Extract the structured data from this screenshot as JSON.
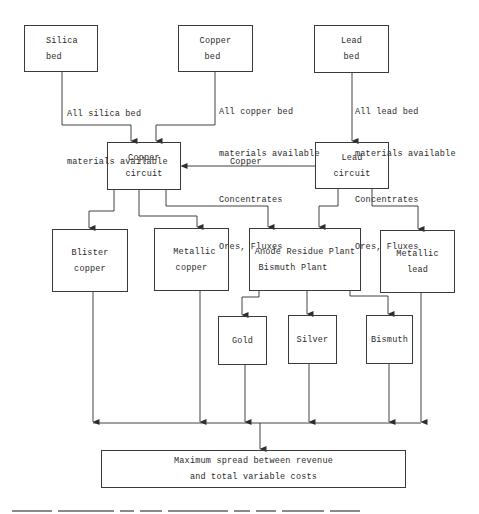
{
  "diagram": {
    "type": "flowchart",
    "nodes": {
      "silica_bed": {
        "line1": "Silica",
        "line2": "bed"
      },
      "copper_bed": {
        "line1": "Copper",
        "line2": "bed"
      },
      "lead_bed": {
        "line1": "Lead",
        "line2": "bed"
      },
      "copper_circuit": {
        "line1": "Copper",
        "line2": "circuit"
      },
      "lead_circuit": {
        "line1": "Lead",
        "line2": "circuit"
      },
      "blister_copper": {
        "line1": "Blister",
        "line2": "copper"
      },
      "metallic_copper": {
        "line1": "Metallic",
        "line2": "copper"
      },
      "anode_residue": {
        "line1": "Anode Residue Plant",
        "line2": "Bismuth Plant"
      },
      "metallic_lead": {
        "line1": "Metallic",
        "line2": "lead"
      },
      "gold": {
        "line1": "Gold"
      },
      "silver": {
        "line1": "Silver"
      },
      "bismuth": {
        "line1": "Bismuth"
      },
      "objective": {
        "line1": "Maximum spread between revenue",
        "line2": "and total variable costs"
      }
    },
    "edge_labels": {
      "silica_to_copper_circuit": {
        "line1": "All silica bed",
        "line2": "materials available"
      },
      "copper_bed_to_copper_circuit": {
        "line1": "All copper bed",
        "line2": "materials available",
        "line3": "Concentrates",
        "line4": "Ores, Fluxes"
      },
      "lead_bed_to_lead_circuit": {
        "line1": "All lead bed",
        "line2": "materials available",
        "line3": "Concentrates",
        "line4": "Ores, Fluxes"
      },
      "lead_circuit_to_copper_circuit": "Copper"
    },
    "edges": [
      [
        "silica_bed",
        "copper_circuit"
      ],
      [
        "copper_bed",
        "copper_circuit"
      ],
      [
        "lead_bed",
        "lead_circuit"
      ],
      [
        "lead_circuit",
        "copper_circuit"
      ],
      [
        "copper_circuit",
        "blister_copper"
      ],
      [
        "copper_circuit",
        "metallic_copper"
      ],
      [
        "copper_circuit",
        "anode_residue"
      ],
      [
        "lead_circuit",
        "anode_residue"
      ],
      [
        "lead_circuit",
        "metallic_lead"
      ],
      [
        "anode_residue",
        "gold"
      ],
      [
        "anode_residue",
        "silver"
      ],
      [
        "anode_residue",
        "bismuth"
      ],
      [
        "blister_copper",
        "objective"
      ],
      [
        "metallic_copper",
        "objective"
      ],
      [
        "gold",
        "objective"
      ],
      [
        "silver",
        "objective"
      ],
      [
        "bismuth",
        "objective"
      ],
      [
        "metallic_lead",
        "objective"
      ]
    ]
  },
  "colors": {
    "line": "#2e2e2e",
    "background": "#ffffff"
  }
}
